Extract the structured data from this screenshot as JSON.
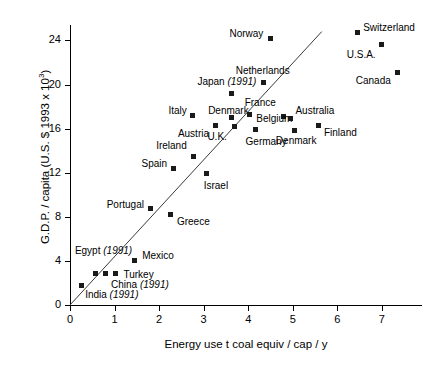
{
  "chart_data": {
    "type": "scatter",
    "title": "",
    "xlabel": "Energy use  t coal equiv / cap / y",
    "ylabel": "G.D.P. / capita (U.S. $ 1993 x 10³)",
    "xlim": [
      0,
      7.9
    ],
    "ylim": [
      0,
      25.4
    ],
    "xticks": [
      0,
      1,
      2,
      3,
      4,
      5,
      6,
      7
    ],
    "yticks": [
      0,
      4,
      8,
      12,
      16,
      20,
      24
    ],
    "grid": false,
    "legend": null,
    "trendline": {
      "x0": 0.0,
      "y0": 0.0,
      "x1": 5.65,
      "y1": 24.8
    },
    "points": [
      {
        "label": "India",
        "note": "(1991)",
        "x": 0.25,
        "y": 1.8,
        "lx": 0.34,
        "ly": 0.9,
        "anchor": "left"
      },
      {
        "label": "Egypt",
        "note": "(1991)",
        "x": 0.58,
        "y": 2.85,
        "lx": 0.11,
        "ly": 4.9,
        "anchor": "left"
      },
      {
        "label": "China",
        "note": "(1991)",
        "x": 0.8,
        "y": 2.9,
        "lx": 0.92,
        "ly": 1.85,
        "anchor": "left"
      },
      {
        "label": "Turkey",
        "note": "",
        "x": 1.03,
        "y": 2.85,
        "lx": 1.2,
        "ly": 2.75,
        "anchor": "left"
      },
      {
        "label": "Mexico",
        "note": "",
        "x": 1.44,
        "y": 4.0,
        "lx": 1.62,
        "ly": 4.45,
        "anchor": "left"
      },
      {
        "label": "Portugal",
        "note": "",
        "x": 1.8,
        "y": 8.75,
        "lx": 1.66,
        "ly": 9.05,
        "anchor": "right"
      },
      {
        "label": "Greece",
        "note": "",
        "x": 2.25,
        "y": 8.2,
        "lx": 2.4,
        "ly": 7.55,
        "anchor": "left"
      },
      {
        "label": "Spain",
        "note": "",
        "x": 2.32,
        "y": 12.4,
        "lx": 2.18,
        "ly": 12.8,
        "anchor": "right"
      },
      {
        "label": "Israel",
        "note": "",
        "x": 3.06,
        "y": 11.9,
        "lx": 3.0,
        "ly": 10.8,
        "anchor": "left"
      },
      {
        "label": "Ireland",
        "note": "",
        "x": 2.78,
        "y": 13.5,
        "lx": 2.62,
        "ly": 14.4,
        "anchor": "right"
      },
      {
        "label": "Italy",
        "note": "",
        "x": 2.76,
        "y": 17.2,
        "lx": 2.62,
        "ly": 17.6,
        "anchor": "right"
      },
      {
        "label": "Austria",
        "note": "",
        "x": 3.27,
        "y": 16.3,
        "lx": 3.12,
        "ly": 15.5,
        "anchor": "right"
      },
      {
        "label": "Denmark",
        "note": "",
        "x": 3.63,
        "y": 17.0,
        "lx": 3.1,
        "ly": 17.6,
        "anchor": "left"
      },
      {
        "label": "U.K.",
        "note": "",
        "x": 3.69,
        "y": 16.2,
        "lx": 3.52,
        "ly": 15.2,
        "anchor": "right"
      },
      {
        "label": "Japan",
        "note": "(1991)",
        "x": 3.62,
        "y": 19.2,
        "lx": 2.86,
        "ly": 20.2,
        "anchor": "left"
      },
      {
        "label": "Netherlands",
        "note": "",
        "x": 4.35,
        "y": 20.2,
        "lx": 3.72,
        "ly": 21.2,
        "anchor": "left"
      },
      {
        "label": "France",
        "note": "",
        "x": 4.02,
        "y": 17.3,
        "lx": 3.92,
        "ly": 18.3,
        "anchor": "left"
      },
      {
        "label": "Belgium",
        "note": "",
        "x": 4.8,
        "y": 17.1,
        "lx": 4.18,
        "ly": 16.9,
        "anchor": "left"
      },
      {
        "label": "Germany",
        "note": "",
        "x": 4.17,
        "y": 15.9,
        "lx": 3.94,
        "ly": 14.8,
        "anchor": "left"
      },
      {
        "label": "Denmark",
        "note": "",
        "x": 5.04,
        "y": 15.8,
        "lx": 4.62,
        "ly": 14.9,
        "anchor": "left"
      },
      {
        "label": "Australia",
        "note": "",
        "x": 4.95,
        "y": 16.9,
        "lx": 5.06,
        "ly": 17.6,
        "anchor": "left"
      },
      {
        "label": "Finland",
        "note": "",
        "x": 5.58,
        "y": 16.3,
        "lx": 5.7,
        "ly": 15.6,
        "anchor": "left"
      },
      {
        "label": "Norway",
        "note": "",
        "x": 4.5,
        "y": 24.2,
        "lx": 4.34,
        "ly": 24.6,
        "anchor": "right"
      },
      {
        "label": "Switzerland",
        "note": "",
        "x": 6.45,
        "y": 24.7,
        "lx": 6.58,
        "ly": 25.1,
        "anchor": "left"
      },
      {
        "label": "U.S.A.",
        "height": 0,
        "note": "",
        "x": 7.0,
        "y": 23.6,
        "lx": 6.86,
        "ly": 22.7,
        "anchor": "right"
      },
      {
        "label": "Canada",
        "note": "",
        "x": 7.35,
        "y": 21.1,
        "lx": 7.2,
        "ly": 20.3,
        "anchor": "right"
      }
    ]
  }
}
